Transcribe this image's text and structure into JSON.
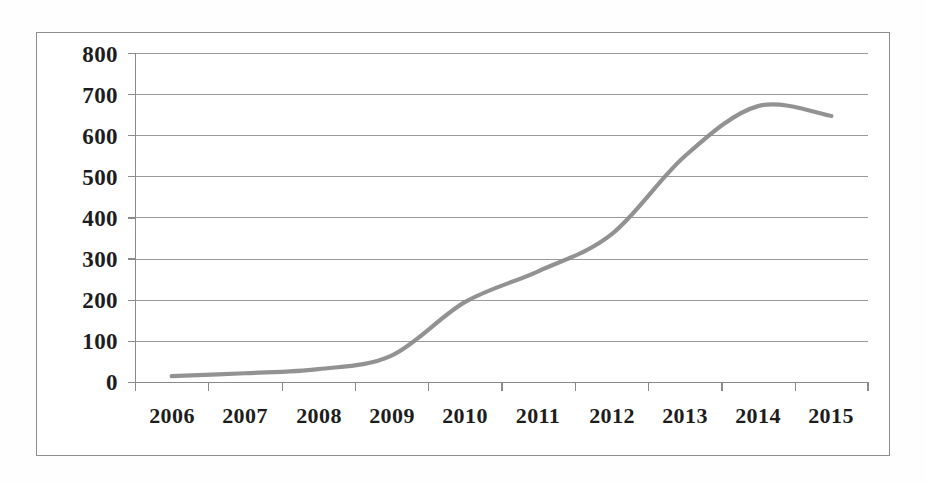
{
  "figure": {
    "kind": "scanned-line-chart",
    "frame_color": "#8d8d8d",
    "page_background": "#fefefe"
  },
  "chart_data": {
    "type": "line",
    "title": "",
    "subtitle": "",
    "xlabel": "",
    "ylabel": "",
    "categories": [
      "2006",
      "2007",
      "2008",
      "2009",
      "2010",
      "2011",
      "2012",
      "2013",
      "2014",
      "2015"
    ],
    "series": [
      {
        "name": "series-1",
        "color": "#8a8a8a",
        "values": [
          15,
          22,
          32,
          65,
          195,
          270,
          360,
          550,
          672,
          648
        ]
      }
    ],
    "values": [
      15,
      22,
      32,
      65,
      195,
      270,
      360,
      550,
      672,
      648
    ],
    "ylim": [
      0,
      800
    ],
    "y_ticks": [
      0,
      100,
      200,
      300,
      400,
      500,
      600,
      700,
      800
    ],
    "y_tick_labels": [
      "0",
      "100",
      "200",
      "300",
      "400",
      "500",
      "600",
      "700",
      "800"
    ],
    "x_tick_labels": [
      "2006",
      "2007",
      "2008",
      "2009",
      "2010",
      "2011",
      "2012",
      "2013",
      "2014",
      "2015"
    ],
    "grid": true,
    "grid_axis": "y",
    "gridline_color": "#9a9a9a",
    "legend": false,
    "legend_position": "none",
    "markers": false,
    "smoothing": "smooth"
  },
  "axes": {
    "y_labels": [
      "800",
      "700",
      "600",
      "500",
      "400",
      "300",
      "200",
      "100",
      "0"
    ],
    "x_labels": [
      "2006",
      "2007",
      "2008",
      "2009",
      "2010",
      "2011",
      "2012",
      "2013",
      "2014",
      "2015"
    ]
  }
}
